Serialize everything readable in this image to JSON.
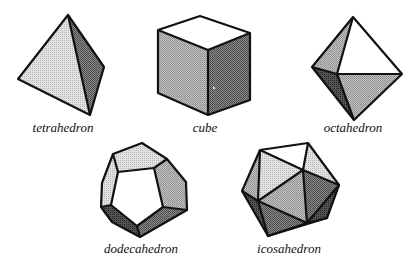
{
  "figure": {
    "solids": [
      {
        "name": "tetrahedron",
        "label": "tetrahedron",
        "faces": 4
      },
      {
        "name": "cube",
        "label": "cube",
        "faces": 6
      },
      {
        "name": "octahedron",
        "label": "octahedron",
        "faces": 8
      },
      {
        "name": "dodecahedron",
        "label": "dodecahedron",
        "faces": 12
      },
      {
        "name": "icosahedron",
        "label": "icosahedron",
        "faces": 20
      }
    ],
    "colors": {
      "white": "#ffffff",
      "light": "#d0d0d0",
      "mid": "#a8a8a8",
      "dark": "#6a6a6a",
      "darkest": "#3a3a3a",
      "edge": "#111111"
    }
  }
}
